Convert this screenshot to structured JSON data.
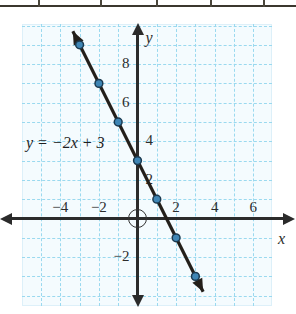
{
  "table_strip": {
    "divider_positions": [
      38,
      100,
      156,
      210,
      263
    ],
    "rule_color": "#3b372e"
  },
  "annotations": {
    "equation_y": "y",
    "equation_eq": "=",
    "equation_rhs_sign": "−",
    "equation_rhs": "2x",
    "equation_plus": "+",
    "equation_const": "3",
    "equation_full": "y = −2x + 3",
    "x_axis_name": "x",
    "y_axis_name": "y"
  },
  "colors": {
    "grid": "#9ad9ef",
    "plot_background": "#f4fbfe",
    "axis": "#2b2b2b",
    "line": "#231f1a",
    "point_fill": "#3f86b5",
    "point_stroke": "#1b3a50"
  },
  "chart_data": {
    "type": "line",
    "title": "",
    "xlabel": "x",
    "ylabel": "y",
    "equation": "y = −2x + 3",
    "slope": -2,
    "intercept": 3,
    "xlim": [
      -5.9,
      6.9
    ],
    "ylim": [
      -3.9,
      10.6
    ],
    "grid": true,
    "grid_step": 1,
    "legend": "none",
    "x_tick_labels": [
      "−4",
      "−2",
      "2",
      "4",
      "6"
    ],
    "x_tick_values": [
      -4,
      -2,
      2,
      4,
      6
    ],
    "y_tick_labels": [
      "8",
      "6",
      "4",
      "2",
      "−2"
    ],
    "y_tick_values": [
      8,
      6,
      4,
      2,
      -2
    ],
    "points": [
      {
        "x": -3,
        "y": 9
      },
      {
        "x": -2,
        "y": 7
      },
      {
        "x": -1,
        "y": 5
      },
      {
        "x": 0,
        "y": 3
      },
      {
        "x": 1,
        "y": 1
      },
      {
        "x": 2,
        "y": -1
      },
      {
        "x": 3,
        "y": -3
      }
    ],
    "series": [
      {
        "name": "y = −2x + 3",
        "x": [
          -3,
          -2,
          -1,
          0,
          1,
          2,
          3
        ],
        "values": [
          9,
          7,
          5,
          3,
          1,
          -1,
          -3
        ]
      }
    ],
    "line_endpoints": {
      "start": {
        "x": -3.35,
        "y": 9.7
      },
      "end": {
        "x": 3.4,
        "y": -3.8
      }
    },
    "arrows": [
      "start",
      "end"
    ]
  }
}
